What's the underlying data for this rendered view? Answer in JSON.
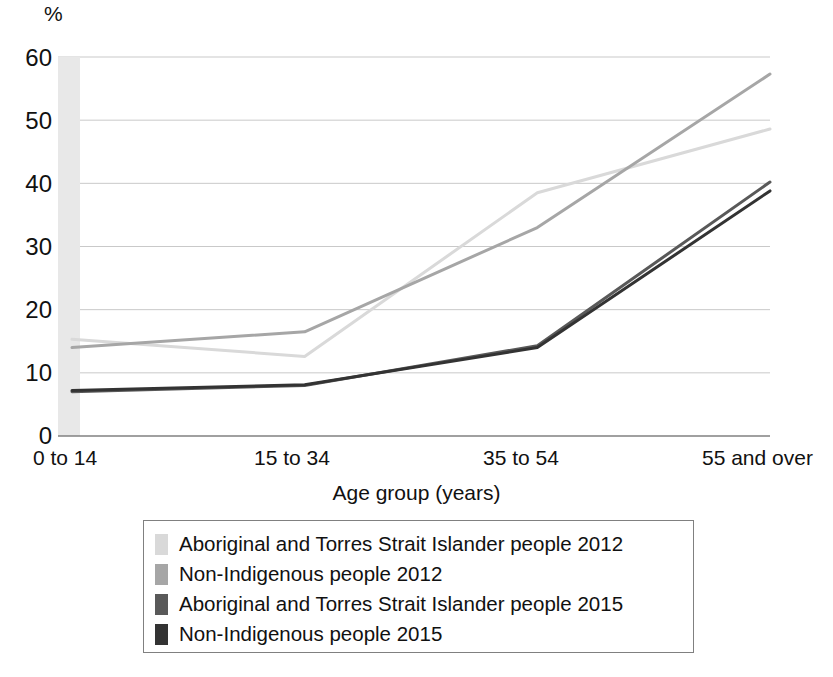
{
  "axis": {
    "y_unit_label": "%",
    "y_ticks": [
      "0",
      "10",
      "20",
      "30",
      "40",
      "50",
      "60"
    ],
    "x_title": "Age group (years)",
    "x_ticks": [
      "0 to 14",
      "15 to 34",
      "35 to 54",
      "55 and over"
    ]
  },
  "legend": {
    "items": [
      {
        "label": "Aboriginal and Torres Strait Islander people 2012",
        "color": "#d9d9d9"
      },
      {
        "label": "Non-Indigenous people 2012",
        "color": "#a6a6a6"
      },
      {
        "label": "Aboriginal and Torres Strait Islander people 2015",
        "color": "#595959"
      },
      {
        "label": "Non-Indigenous people 2015",
        "color": "#333333"
      }
    ]
  },
  "chart_data": {
    "type": "line",
    "title": "",
    "subtitle": "",
    "xlabel": "Age group (years)",
    "ylabel": "%",
    "categories": [
      "0 to 14",
      "15 to 34",
      "35 to 54",
      "55 and over"
    ],
    "ylim": [
      0,
      60
    ],
    "ytick_values": [
      0,
      10,
      20,
      30,
      40,
      50,
      60
    ],
    "grid": true,
    "legend_position": "bottom",
    "series": [
      {
        "name": "Aboriginal and Torres Strait Islander people 2012",
        "color": "#d9d9d9",
        "values": [
          15.3,
          12.6,
          38.5,
          48.6
        ]
      },
      {
        "name": "Non-Indigenous people 2012",
        "color": "#a6a6a6",
        "values": [
          14.0,
          16.5,
          33.0,
          57.3
        ]
      },
      {
        "name": "Aboriginal and Torres Strait Islander people 2015",
        "color": "#595959",
        "values": [
          7.0,
          8.0,
          14.3,
          40.2
        ]
      },
      {
        "name": "Non-Indigenous people 2015",
        "color": "#333333",
        "values": [
          7.2,
          8.1,
          14.0,
          38.8
        ]
      }
    ],
    "annotations": [
      {
        "type": "shaded-band",
        "note": "light grey vertical band at left edge of plot area"
      }
    ]
  }
}
